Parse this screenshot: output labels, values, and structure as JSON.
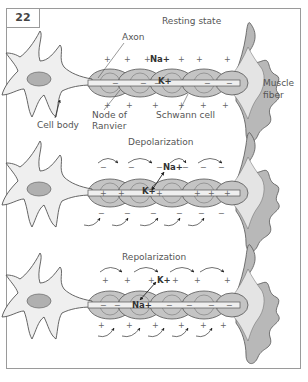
{
  "figure": {
    "number": "22",
    "panels": [
      {
        "title": "Resting state",
        "ions": {
          "outer": "Na+",
          "inner": "K+"
        },
        "labels": {
          "axon": "Axon",
          "cell_body": "Cell body",
          "node_of_ranvier": "Node of Ranvier",
          "node_line1": "Node of",
          "node_line2": "Ranvier",
          "schwann_cell": "Schwann cell",
          "muscle_fiber_line1": "Muscle",
          "muscle_fiber_line2": "fiber"
        },
        "outside_sign": "+",
        "inside_sign": "−"
      },
      {
        "title": "Depolarization",
        "ions": {
          "top": "Na+",
          "bottom": "K+"
        },
        "outside_sign": "−",
        "inside_sign": "+"
      },
      {
        "title": "Repolarization",
        "ions": {
          "top": "K+",
          "bottom": "Na+"
        },
        "outside_sign": "+",
        "inside_sign": "−"
      }
    ],
    "colors": {
      "cell_fill": "#efefef",
      "schwann_fill": "#c4c4c4",
      "muscle_fill": "#b8b8b8",
      "outline": "#555555",
      "nucleus": "#b0b0b0",
      "border": "#9a9a9a"
    }
  }
}
